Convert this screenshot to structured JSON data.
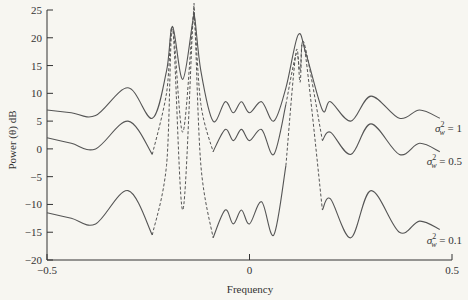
{
  "chart_data": {
    "type": "line",
    "title": "",
    "xlabel": "Frequency",
    "ylabel": "Power (θ) dB",
    "xlim": [
      -0.5,
      0.5
    ],
    "ylim": [
      -20,
      25
    ],
    "x_ticks": [
      -0.5,
      0,
      0.5
    ],
    "x_tick_labels": [
      "−0.5",
      "0",
      "0.5"
    ],
    "y_ticks": [
      25,
      20,
      15,
      10,
      5,
      0,
      -5,
      -10,
      -15,
      -20
    ],
    "y_tick_labels": [
      "25",
      "20",
      "15",
      "10",
      "5",
      "0",
      "−5",
      "−10",
      "−15",
      "−20"
    ],
    "grid": false,
    "legend_position": "inline-right",
    "series": [
      {
        "name": "σ²_w = 1",
        "label_main": "σ",
        "label_sup": "2",
        "label_sub": "w",
        "label_rest": " = 1",
        "style": "solid",
        "x": [
          -0.5,
          -0.44,
          -0.38,
          -0.3,
          -0.24,
          -0.205,
          -0.19,
          -0.165,
          -0.14,
          -0.135,
          -0.12,
          -0.09,
          -0.06,
          -0.04,
          -0.02,
          0.0,
          0.03,
          0.06,
          0.09,
          0.12,
          0.14,
          0.18,
          0.2,
          0.25,
          0.3,
          0.37,
          0.42,
          0.47
        ],
        "y": [
          7,
          6.5,
          6,
          11,
          5.5,
          14,
          22,
          12.5,
          23,
          23.5,
          14,
          5,
          8.5,
          6.5,
          8.5,
          6.5,
          8.5,
          5,
          11,
          20.5,
          17,
          7,
          8.5,
          5,
          9.5,
          5.5,
          7,
          5.5
        ]
      },
      {
        "name": "σ²_w = 0.5",
        "label_main": "σ",
        "label_sup": "2",
        "label_sub": "w",
        "label_rest": " = 0.5",
        "style": "mixed",
        "x": [
          -0.5,
          -0.44,
          -0.38,
          -0.3,
          -0.24,
          -0.205,
          -0.19,
          -0.165,
          -0.14,
          -0.135,
          -0.12,
          -0.09,
          -0.06,
          -0.04,
          -0.02,
          0.0,
          0.03,
          0.06,
          0.09,
          0.115,
          0.125,
          0.135,
          0.18,
          0.2,
          0.25,
          0.3,
          0.37,
          0.42,
          0.47
        ],
        "y": [
          2,
          1,
          0,
          5,
          -1,
          10,
          22,
          3,
          23,
          23,
          8,
          -0.5,
          3.5,
          1.5,
          3.5,
          1.5,
          3.5,
          -1,
          8,
          17,
          14,
          19,
          1.5,
          3,
          -1,
          4.5,
          -1,
          1,
          -0.5
        ]
      },
      {
        "name": "σ²_w = 0.1",
        "label_main": "σ",
        "label_sup": "2",
        "label_sub": "w",
        "label_rest": " = 0.1",
        "style": "mixed",
        "x": [
          -0.5,
          -0.44,
          -0.38,
          -0.3,
          -0.24,
          -0.205,
          -0.19,
          -0.165,
          -0.14,
          -0.135,
          -0.12,
          -0.09,
          -0.06,
          -0.04,
          -0.02,
          0.0,
          0.03,
          0.06,
          0.09,
          0.115,
          0.125,
          0.135,
          0.18,
          0.2,
          0.25,
          0.3,
          0.37,
          0.42,
          0.47
        ],
        "y": [
          -11.5,
          -12.5,
          -13.5,
          -7.5,
          -15.5,
          -3,
          21.5,
          -11,
          22.5,
          22.5,
          -3,
          -16,
          -11,
          -13.5,
          -11,
          -13.5,
          -9.5,
          -15.5,
          -3,
          17.5,
          12,
          18.5,
          -11,
          -9,
          -16,
          -7.5,
          -15,
          -13,
          -14.5
        ]
      }
    ]
  }
}
